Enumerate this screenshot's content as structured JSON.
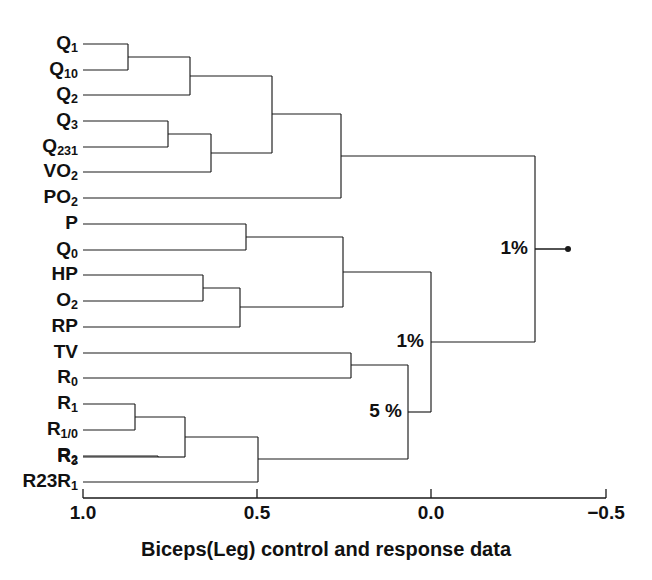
{
  "figure": {
    "type": "dendrogram",
    "caption": "Biceps(Leg) control and response data",
    "background_color": "#ffffff",
    "line_color": "#1a1a1a"
  },
  "axis": {
    "orientation": "horizontal",
    "direction": "decreasing-left-to-right",
    "ticks": [
      {
        "label": "1.0",
        "value": 1.0,
        "x": 83
      },
      {
        "label": "0.5",
        "value": 0.5,
        "x": 257
      },
      {
        "label": "0.0",
        "value": 0.0,
        "x": 431
      },
      {
        "label": "−0.5",
        "value": -0.5,
        "x": 606
      }
    ],
    "y": 498,
    "range": [
      1.0,
      -0.5
    ]
  },
  "leaves": [
    {
      "id": "Q1",
      "base": "Q",
      "sub": "1",
      "y": 44
    },
    {
      "id": "Q10",
      "base": "Q",
      "sub": "10",
      "y": 70
    },
    {
      "id": "Q2",
      "base": "Q",
      "sub": "2",
      "y": 95
    },
    {
      "id": "Q3",
      "base": "Q",
      "sub": "3",
      "y": 121
    },
    {
      "id": "Q231",
      "base": "Q",
      "sub": "231",
      "y": 147
    },
    {
      "id": "VO2",
      "base": "VO",
      "sub": "2",
      "y": 172
    },
    {
      "id": "PO2",
      "base": "PO",
      "sub": "2",
      "y": 198
    },
    {
      "id": "P",
      "base": "P",
      "sub": "",
      "y": 224
    },
    {
      "id": "Q0",
      "base": "Q",
      "sub": "0",
      "y": 250
    },
    {
      "id": "HP",
      "base": "HP",
      "sub": "",
      "y": 275
    },
    {
      "id": "O2",
      "base": "O",
      "sub": "2",
      "y": 301
    },
    {
      "id": "RP",
      "base": "RP",
      "sub": "",
      "y": 327
    },
    {
      "id": "TV",
      "base": "TV",
      "sub": "",
      "y": 353
    },
    {
      "id": "R0",
      "base": "R",
      "sub": "0",
      "y": 378
    },
    {
      "id": "R1",
      "base": "R",
      "sub": "1",
      "y": 404
    },
    {
      "id": "R1_0",
      "base": "R",
      "sub": "1/0",
      "y": 430
    },
    {
      "id": "R2",
      "base": "R",
      "sub": "2",
      "y": 456
    },
    {
      "id": "R3",
      "base": "R",
      "sub": "3",
      "y": 457
    },
    {
      "id": "R23R1",
      "base": "R23R",
      "sub": "1",
      "y": 482
    }
  ],
  "leaf_order": [
    "Q1",
    "Q10",
    "Q2",
    "Q3",
    "Q231",
    "VO2",
    "PO2",
    "P",
    "Q0",
    "HP",
    "O2",
    "RP",
    "TV",
    "R0",
    "R1",
    "R1_0",
    "R2",
    "R3",
    "R23R1"
  ],
  "merges": [
    {
      "id": "m1",
      "name": "Q1-Q10",
      "children": [
        "Q1",
        "Q10"
      ],
      "x": 128,
      "similarity": 0.87,
      "y_top": 44,
      "y_bot": 70,
      "y_out": 57
    },
    {
      "id": "m2",
      "name": "Q1Q10-Q2",
      "children": [
        "m1",
        "Q2"
      ],
      "x": 190,
      "similarity": 0.69,
      "y_top": 57,
      "y_bot": 95,
      "y_out": 76
    },
    {
      "id": "m3",
      "name": "Q3-Q231",
      "children": [
        "Q3",
        "Q231"
      ],
      "x": 168,
      "similarity": 0.76,
      "y_top": 121,
      "y_bot": 147,
      "y_out": 134
    },
    {
      "id": "m4",
      "name": "Q3Q231-VO2",
      "children": [
        "m3",
        "VO2"
      ],
      "x": 211,
      "similarity": 0.63,
      "y_top": 134,
      "y_bot": 172,
      "y_out": 153
    },
    {
      "id": "m5",
      "name": "Qcluster-VO2cluster",
      "children": [
        "m2",
        "m4"
      ],
      "x": 272,
      "similarity": 0.46,
      "y_top": 76,
      "y_bot": 153,
      "y_out": 114
    },
    {
      "id": "m6",
      "name": "upper-PO2",
      "children": [
        "m5",
        "PO2"
      ],
      "x": 341,
      "similarity": 0.26,
      "y_top": 114,
      "y_bot": 198,
      "y_out": 156
    },
    {
      "id": "m7",
      "name": "P-Q0",
      "children": [
        "P",
        "Q0"
      ],
      "x": 246,
      "similarity": 0.53,
      "y_top": 224,
      "y_bot": 250,
      "y_out": 237
    },
    {
      "id": "m8",
      "name": "HP-O2",
      "children": [
        "HP",
        "O2"
      ],
      "x": 203,
      "similarity": 0.65,
      "y_top": 275,
      "y_bot": 301,
      "y_out": 288
    },
    {
      "id": "m9",
      "name": "HPO2-RP",
      "children": [
        "m8",
        "RP"
      ],
      "x": 240,
      "similarity": 0.55,
      "y_top": 288,
      "y_bot": 327,
      "y_out": 307
    },
    {
      "id": "m10",
      "name": "PQ0-HPO2RP",
      "children": [
        "m7",
        "m9"
      ],
      "x": 343,
      "similarity": 0.25,
      "y_top": 237,
      "y_bot": 307,
      "y_out": 272
    },
    {
      "id": "m11",
      "name": "TV-R0",
      "children": [
        "TV",
        "R0"
      ],
      "x": 351,
      "similarity": 0.23,
      "y_top": 353,
      "y_bot": 378,
      "y_out": 365
    },
    {
      "id": "m12",
      "name": "R1-R1_0",
      "children": [
        "R1",
        "R1_0"
      ],
      "x": 135,
      "similarity": 0.85,
      "y_top": 404,
      "y_bot": 430,
      "y_out": 417
    },
    {
      "id": "m13",
      "name": "R2-R3",
      "children": [
        "R2",
        "R3"
      ],
      "x": 158,
      "similarity": 0.78,
      "y_top": 456,
      "y_bot": 457,
      "y_out": 457
    },
    {
      "id": "m14",
      "name": "R1group-R2R3",
      "children": [
        "m12",
        "m13"
      ],
      "x": 185,
      "similarity": 0.71,
      "y_top": 417,
      "y_bot": 457,
      "y_out": 437
    },
    {
      "id": "m15",
      "name": "Rgroup-R23R1",
      "children": [
        "m14",
        "R23R1"
      ],
      "x": 258,
      "similarity": 0.5,
      "y_top": 437,
      "y_bot": 482,
      "y_out": 459
    },
    {
      "id": "m16",
      "name": "TVR0-Rgroup",
      "children": [
        "m11",
        "m15"
      ],
      "x": 408,
      "similarity": 0.07,
      "y_top": 365,
      "y_bot": 459,
      "y_out": 412,
      "label": "5 %"
    },
    {
      "id": "m17",
      "name": "middle-lower",
      "children": [
        "m10",
        "m16"
      ],
      "x": 431,
      "similarity": 0.0,
      "y_top": 272,
      "y_bot": 412,
      "y_out": 342,
      "label": "1%"
    },
    {
      "id": "m18",
      "name": "root",
      "children": [
        "m6",
        "m17"
      ],
      "x": 535,
      "similarity": -0.3,
      "y_top": 156,
      "y_bot": 342,
      "y_out": 249,
      "label": "1%"
    }
  ],
  "node_labels": [
    {
      "text": "1%",
      "x": 528,
      "y": 249,
      "for": "m18"
    },
    {
      "text": "1%",
      "x": 424,
      "y": 342,
      "for": "m17"
    },
    {
      "text": "5 %",
      "x": 402,
      "y": 412,
      "for": "m16"
    }
  ],
  "root_stub": {
    "x1": 535,
    "x2": 568,
    "y": 249,
    "dot_r": 3
  },
  "caption": {
    "text": "Biceps(Leg) control and response data",
    "x": 326,
    "y": 556
  }
}
